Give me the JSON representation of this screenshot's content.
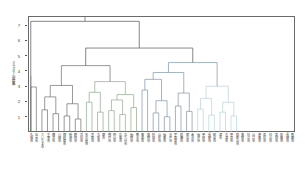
{
  "figure": {
    "kind": "dendrogram",
    "axis_label_vertical": "クラスター間距離",
    "frame_color": "#6a6a6a",
    "background": "#ffffff"
  },
  "yaxis": {
    "ticks": [
      1,
      2,
      3,
      4,
      5,
      6,
      7
    ],
    "tick_labels": [
      "1",
      "2",
      "3",
      "4",
      "5",
      "6",
      "7"
    ],
    "min": 0,
    "max": 7.6
  },
  "chart_data": {
    "type": "line",
    "title": "",
    "xlabel": "",
    "ylabel": "クラスター間距離",
    "ylim": [
      0,
      7.6
    ],
    "grid": false,
    "legend_position": "none",
    "n_leaves": 48,
    "cluster_colors": {
      "root": "#707070",
      "cluster_1": "#6e6e6e",
      "cluster_2": "#8fa98c",
      "cluster_3": "#7f93a8",
      "cluster_4": "#b9d2d8"
    },
    "leaf_labels": [
      "札幌市",
      "仙台市",
      "さいたま市",
      "千葉市",
      "横浜市",
      "川崎市",
      "相模原市",
      "新潟市",
      "静岡市",
      "浜松市",
      "名古屋市",
      "京都市",
      "大阪市",
      "堺市",
      "神戸市",
      "岡山市",
      "広島市",
      "北九州市",
      "福岡市",
      "熊本市",
      "青森市",
      "盛岡市",
      "秋田市",
      "山形市",
      "福島市",
      "水戸市",
      "宇都宮市",
      "前橋市",
      "富山市",
      "金沢市",
      "福井市",
      "甲府市",
      "長野市",
      "岐阜市",
      "津市",
      "大津市",
      "奈良市",
      "和歌山市",
      "鳥取市",
      "松江市",
      "山口市",
      "徳島市",
      "高松市",
      "松山市",
      "高知市",
      "佐賀市",
      "長崎市",
      "那覇市"
    ],
    "merges": [
      {
        "id": "m1",
        "x": 1.5,
        "h": 2.95,
        "left": 1,
        "right": 2,
        "color": "cluster_1"
      },
      {
        "id": "m2",
        "x": 3.5,
        "h": 1.45,
        "left": 3,
        "right": 4,
        "color": "cluster_1"
      },
      {
        "id": "m3",
        "x": 5.5,
        "h": 1.2,
        "left": 5,
        "right": 6,
        "color": "cluster_1"
      },
      {
        "id": "m4",
        "x": 4.5,
        "h": 2.3,
        "left": "m2",
        "right": "m3",
        "color": "cluster_1"
      },
      {
        "id": "m5",
        "x": 7.5,
        "h": 1.05,
        "left": 7,
        "right": 8,
        "color": "cluster_1"
      },
      {
        "id": "m6",
        "x": 9.5,
        "h": 0.85,
        "left": 9,
        "right": 10,
        "color": "cluster_1"
      },
      {
        "id": "m7",
        "x": 8.5,
        "h": 1.85,
        "left": "m5",
        "right": "m6",
        "color": "cluster_1"
      },
      {
        "id": "m8",
        "x": 6.5,
        "h": 3.05,
        "left": "m4",
        "right": "m7",
        "color": "cluster_1"
      },
      {
        "id": "m9",
        "x": 12.5,
        "h": 1.95,
        "left": 11,
        "right": 12,
        "color": "cluster_2"
      },
      {
        "id": "m10",
        "x": 14.5,
        "h": 1.3,
        "left": 13,
        "right": 14,
        "color": "cluster_2"
      },
      {
        "id": "m11",
        "x": 13.5,
        "h": 2.6,
        "left": "m9",
        "right": "m10",
        "color": "cluster_2"
      },
      {
        "id": "m12",
        "x": 17.5,
        "h": 1.4,
        "left": 15,
        "right": 16,
        "color": "cluster_2"
      },
      {
        "id": "m13",
        "x": 19.5,
        "h": 1.15,
        "left": 17,
        "right": 18,
        "color": "cluster_2"
      },
      {
        "id": "m14",
        "x": 18.5,
        "h": 2.1,
        "left": "m12",
        "right": "m13",
        "color": "cluster_2"
      },
      {
        "id": "m15",
        "x": 22.5,
        "h": 1.6,
        "left": 19,
        "right": 20,
        "color": "cluster_2"
      },
      {
        "id": "m16",
        "x": 21.0,
        "h": 2.45,
        "left": "m14",
        "right": "m15",
        "color": "cluster_2"
      },
      {
        "id": "m17",
        "x": 16.0,
        "h": 3.3,
        "left": "m11",
        "right": "m16",
        "color": "cluster_2"
      },
      {
        "id": "m18",
        "x": 11.0,
        "h": 4.35,
        "left": "m8",
        "right": "m17",
        "color": "cluster_1"
      },
      {
        "id": "m19",
        "x": 26.5,
        "h": 2.75,
        "left": 21,
        "right": 22,
        "color": "cluster_3"
      },
      {
        "id": "m20",
        "x": 29.5,
        "h": 1.25,
        "left": 23,
        "right": 24,
        "color": "cluster_3"
      },
      {
        "id": "m21",
        "x": 31.5,
        "h": 1.0,
        "left": 25,
        "right": 26,
        "color": "cluster_3"
      },
      {
        "id": "m22",
        "x": 30.5,
        "h": 2.05,
        "left": "m20",
        "right": "m21",
        "color": "cluster_3"
      },
      {
        "id": "m23",
        "x": 28.0,
        "h": 3.45,
        "left": "m19",
        "right": "m22",
        "color": "cluster_3"
      },
      {
        "id": "m24",
        "x": 34.5,
        "h": 1.7,
        "left": 27,
        "right": 28,
        "color": "cluster_3"
      },
      {
        "id": "m25",
        "x": 36.5,
        "h": 1.35,
        "left": 29,
        "right": 30,
        "color": "cluster_3"
      },
      {
        "id": "m26",
        "x": 35.5,
        "h": 2.55,
        "left": "m24",
        "right": "m25",
        "color": "cluster_3"
      },
      {
        "id": "m27",
        "x": 33.0,
        "h": 3.9,
        "left": "m23",
        "right": "m26",
        "color": "cluster_3"
      },
      {
        "id": "m28",
        "x": 40.5,
        "h": 1.5,
        "left": 31,
        "right": 32,
        "color": "cluster_4"
      },
      {
        "id": "m29",
        "x": 42.5,
        "h": 1.1,
        "left": 33,
        "right": 34,
        "color": "cluster_4"
      },
      {
        "id": "m30",
        "x": 41.5,
        "h": 2.2,
        "left": "m28",
        "right": "m29",
        "color": "cluster_4"
      },
      {
        "id": "m31",
        "x": 45.5,
        "h": 1.3,
        "left": 35,
        "right": 36,
        "color": "cluster_4"
      },
      {
        "id": "m32",
        "x": 47.5,
        "h": 1.05,
        "left": 37,
        "right": 38,
        "color": "cluster_4"
      },
      {
        "id": "m33",
        "x": 46.5,
        "h": 1.95,
        "left": "m31",
        "right": "m32",
        "color": "cluster_4"
      },
      {
        "id": "m34",
        "x": 44.0,
        "h": 3.0,
        "left": "m30",
        "right": "m33",
        "color": "cluster_4"
      },
      {
        "id": "m35",
        "x": 38.5,
        "h": 4.55,
        "left": "m27",
        "right": "m34",
        "color": "cluster_3"
      },
      {
        "id": "m36",
        "x": 24.0,
        "h": 5.5,
        "left": "m18",
        "right": "m35",
        "color": "root"
      },
      {
        "id": "m37",
        "x": 0.5,
        "h": 3.7,
        "left": 0,
        "right": 0,
        "color": "cluster_1"
      },
      {
        "id": "root",
        "x": 12.0,
        "h": 7.25,
        "left": "m37",
        "right": "m36",
        "color": "root"
      }
    ]
  }
}
